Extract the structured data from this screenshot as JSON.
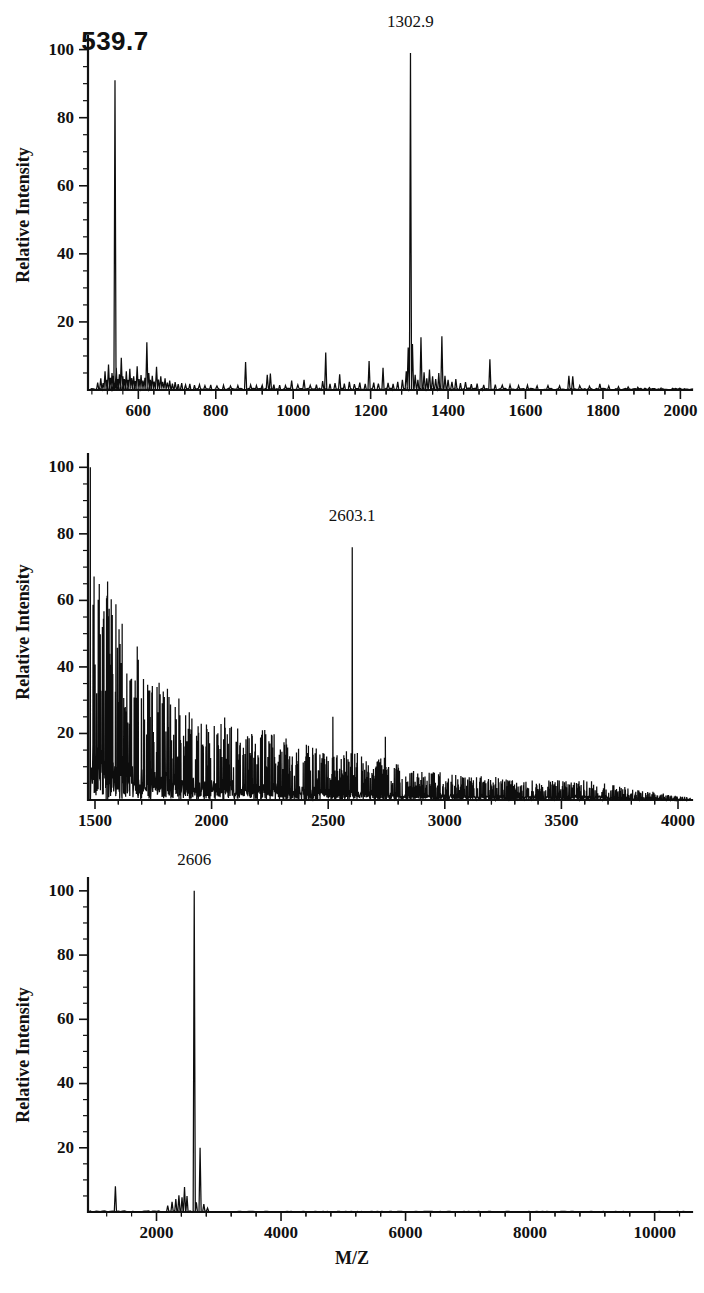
{
  "figure": {
    "background": "#ffffff",
    "ink_color": "#111111",
    "xlabel": "M/Z",
    "ylabel": "Relative Intensity"
  },
  "chart_data": [
    {
      "type": "line",
      "panel": "top",
      "title": "",
      "xlabel": "",
      "ylabel": "Relative Intensity",
      "xlim": [
        470,
        2030
      ],
      "ylim": [
        0,
        104
      ],
      "xticks": [
        600,
        800,
        1000,
        1200,
        1400,
        1600,
        1800,
        2000
      ],
      "xtick_labels": [
        "600",
        "800",
        "1000",
        "1200",
        "1400",
        "1600",
        "1800",
        "2000"
      ],
      "yticks": [
        20,
        40,
        60,
        80,
        100
      ],
      "ytick_labels": [
        "20",
        "40",
        "60",
        "80",
        "100"
      ],
      "ytick_minor_step": 5,
      "grid": false,
      "legend": null,
      "annotations": [
        {
          "text": "539.7",
          "x": 539.7,
          "y": 91,
          "style": "large-bold"
        },
        {
          "text": "1302.9",
          "x": 1302.9,
          "y": 99,
          "style": "normal"
        }
      ],
      "peaks": [
        [
          495,
          2.2
        ],
        [
          503,
          3.4
        ],
        [
          509,
          2.0
        ],
        [
          514,
          5.5
        ],
        [
          519,
          3.0
        ],
        [
          523,
          7.5
        ],
        [
          528,
          3.6
        ],
        [
          532,
          5.0
        ],
        [
          536,
          4.2
        ],
        [
          539.7,
          91.0
        ],
        [
          543,
          6.5
        ],
        [
          547,
          3.2
        ],
        [
          551,
          4.6
        ],
        [
          556,
          9.5
        ],
        [
          560,
          4.0
        ],
        [
          564,
          3.2
        ],
        [
          569,
          5.5
        ],
        [
          573,
          3.0
        ],
        [
          578,
          6.2
        ],
        [
          583,
          3.5
        ],
        [
          588,
          4.0
        ],
        [
          592,
          2.6
        ],
        [
          597,
          7.0
        ],
        [
          602,
          3.2
        ],
        [
          607,
          4.4
        ],
        [
          612,
          2.8
        ],
        [
          617,
          3.6
        ],
        [
          622,
          14.0
        ],
        [
          627,
          5.0
        ],
        [
          631,
          3.0
        ],
        [
          636,
          4.2
        ],
        [
          641,
          2.5
        ],
        [
          647,
          6.8
        ],
        [
          652,
          3.1
        ],
        [
          658,
          4.0
        ],
        [
          663,
          2.4
        ],
        [
          669,
          3.4
        ],
        [
          675,
          2.2
        ],
        [
          681,
          2.8
        ],
        [
          688,
          1.9
        ],
        [
          695,
          2.3
        ],
        [
          703,
          1.7
        ],
        [
          712,
          2.0
        ],
        [
          722,
          1.5
        ],
        [
          733,
          1.8
        ],
        [
          745,
          1.4
        ],
        [
          758,
          1.6
        ],
        [
          772,
          1.3
        ],
        [
          787,
          1.5
        ],
        [
          803,
          1.2
        ],
        [
          820,
          1.4
        ],
        [
          838,
          1.2
        ],
        [
          857,
          1.3
        ],
        [
          877,
          8.2
        ],
        [
          890,
          1.5
        ],
        [
          905,
          1.3
        ],
        [
          920,
          1.4
        ],
        [
          933,
          4.5
        ],
        [
          941,
          4.8
        ],
        [
          950,
          1.6
        ],
        [
          965,
          1.4
        ],
        [
          980,
          1.3
        ],
        [
          996,
          2.8
        ],
        [
          1012,
          1.5
        ],
        [
          1028,
          3.0
        ],
        [
          1044,
          1.4
        ],
        [
          1060,
          1.6
        ],
        [
          1076,
          2.6
        ],
        [
          1084,
          11.0
        ],
        [
          1095,
          1.8
        ],
        [
          1108,
          2.0
        ],
        [
          1120,
          4.6
        ],
        [
          1132,
          1.9
        ],
        [
          1145,
          2.4
        ],
        [
          1158,
          1.7
        ],
        [
          1172,
          2.2
        ],
        [
          1186,
          1.8
        ],
        [
          1196,
          8.5
        ],
        [
          1208,
          2.2
        ],
        [
          1220,
          1.9
        ],
        [
          1232,
          6.5
        ],
        [
          1245,
          2.1
        ],
        [
          1258,
          1.8
        ],
        [
          1270,
          2.4
        ],
        [
          1282,
          3.0
        ],
        [
          1292,
          5.5
        ],
        [
          1297,
          12.5
        ],
        [
          1302.9,
          99.0
        ],
        [
          1308,
          13.5
        ],
        [
          1315,
          4.5
        ],
        [
          1322,
          3.0
        ],
        [
          1330,
          15.5
        ],
        [
          1338,
          5.2
        ],
        [
          1345,
          3.4
        ],
        [
          1352,
          6.0
        ],
        [
          1360,
          4.0
        ],
        [
          1368,
          3.2
        ],
        [
          1376,
          5.0
        ],
        [
          1384,
          15.8
        ],
        [
          1392,
          4.2
        ],
        [
          1400,
          3.0
        ],
        [
          1410,
          2.4
        ],
        [
          1420,
          3.2
        ],
        [
          1432,
          2.0
        ],
        [
          1445,
          2.3
        ],
        [
          1460,
          1.7
        ],
        [
          1475,
          1.9
        ],
        [
          1492,
          1.5
        ],
        [
          1508,
          9.0
        ],
        [
          1522,
          1.6
        ],
        [
          1540,
          1.4
        ],
        [
          1560,
          1.5
        ],
        [
          1582,
          1.3
        ],
        [
          1605,
          1.4
        ],
        [
          1630,
          1.2
        ],
        [
          1658,
          1.3
        ],
        [
          1688,
          1.2
        ],
        [
          1712,
          4.2
        ],
        [
          1722,
          4.0
        ],
        [
          1740,
          1.3
        ],
        [
          1765,
          1.1
        ],
        [
          1792,
          1.8
        ],
        [
          1815,
          1.2
        ],
        [
          1840,
          1.0
        ],
        [
          1865,
          0.9
        ],
        [
          1890,
          0.8
        ],
        [
          1920,
          0.7
        ],
        [
          1950,
          0.6
        ],
        [
          1980,
          0.5
        ],
        [
          2010,
          0.4
        ]
      ]
    },
    {
      "type": "line",
      "panel": "middle",
      "title": "",
      "xlabel": "",
      "ylabel": "Relative Intensity",
      "xlim": [
        1470,
        4060
      ],
      "ylim": [
        0,
        104
      ],
      "xticks": [
        1500,
        2000,
        2500,
        3000,
        3500,
        4000
      ],
      "xtick_labels": [
        "1500",
        "2000",
        "2500",
        "3000",
        "3500",
        "4000"
      ],
      "yticks": [
        20,
        40,
        60,
        80,
        100
      ],
      "ytick_labels": [
        "20",
        "40",
        "60",
        "80",
        "100"
      ],
      "ytick_minor_step": 5,
      "grid": false,
      "legend": null,
      "annotations": [
        {
          "text": "2603.1",
          "x": 2603.1,
          "y": 76,
          "style": "normal"
        }
      ],
      "description": "Dense noisy chemical-background spectrum decaying from 100% at m/z 1480 to near baseline by m/z 4000, with a single sharp labelled peak at 2603.1 reaching ~76% relative intensity.",
      "envelope": [
        [
          1480,
          100
        ],
        [
          1500,
          62
        ],
        [
          1540,
          58
        ],
        [
          1580,
          52
        ],
        [
          1620,
          44
        ],
        [
          1660,
          40
        ],
        [
          1700,
          37
        ],
        [
          1750,
          33
        ],
        [
          1800,
          29
        ],
        [
          1850,
          26
        ],
        [
          1900,
          24
        ],
        [
          1950,
          23
        ],
        [
          2000,
          22
        ],
        [
          2050,
          21
        ],
        [
          2100,
          20
        ],
        [
          2150,
          19
        ],
        [
          2200,
          19
        ],
        [
          2250,
          17
        ],
        [
          2300,
          16
        ],
        [
          2350,
          15
        ],
        [
          2400,
          14
        ],
        [
          2450,
          13
        ],
        [
          2500,
          12
        ],
        [
          2550,
          12
        ],
        [
          2600,
          13
        ],
        [
          2650,
          11
        ],
        [
          2700,
          10
        ],
        [
          2750,
          11
        ],
        [
          2800,
          9
        ],
        [
          2850,
          8
        ],
        [
          2900,
          8
        ],
        [
          2950,
          7
        ],
        [
          3000,
          7
        ],
        [
          3100,
          6
        ],
        [
          3200,
          6
        ],
        [
          3300,
          5
        ],
        [
          3400,
          5
        ],
        [
          3500,
          5
        ],
        [
          3600,
          5
        ],
        [
          3700,
          4
        ],
        [
          3800,
          3
        ],
        [
          3900,
          2
        ],
        [
          4000,
          1
        ]
      ],
      "marker_peaks": [
        [
          2603.1,
          76.0
        ],
        [
          2520,
          25
        ],
        [
          2745,
          19
        ],
        [
          2218,
          21
        ],
        [
          2085,
          22
        ]
      ]
    },
    {
      "type": "line",
      "panel": "bottom",
      "title": "",
      "xlabel": "M/Z",
      "ylabel": "Relative Intensity",
      "xlim": [
        900,
        10600
      ],
      "ylim": [
        0,
        104
      ],
      "xticks": [
        2000,
        4000,
        6000,
        8000,
        10000
      ],
      "xtick_labels": [
        "2000",
        "4000",
        "6000",
        "8000",
        "10000"
      ],
      "yticks": [
        20,
        40,
        60,
        80,
        100
      ],
      "ytick_labels": [
        "20",
        "40",
        "60",
        "80",
        "100"
      ],
      "ytick_minor_step": 5,
      "grid": false,
      "legend": null,
      "annotations": [
        {
          "text": "2606",
          "x": 2606,
          "y": 100,
          "style": "normal"
        }
      ],
      "peaks": [
        [
          1340,
          8.0
        ],
        [
          2180,
          2.0
        ],
        [
          2250,
          3.2
        ],
        [
          2310,
          4.0
        ],
        [
          2360,
          5.2
        ],
        [
          2410,
          4.6
        ],
        [
          2450,
          7.8
        ],
        [
          2490,
          5.0
        ],
        [
          2606,
          100.0
        ],
        [
          2640,
          3.0
        ],
        [
          2700,
          20.0
        ],
        [
          2760,
          2.5
        ],
        [
          2820,
          1.2
        ]
      ],
      "baseline_noise": 0.5
    }
  ]
}
